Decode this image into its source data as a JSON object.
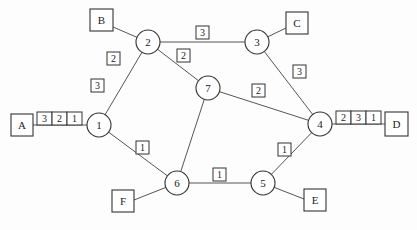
{
  "diagram": {
    "type": "network-topology",
    "routers": [
      {
        "id": "1",
        "label": "1",
        "x": 99,
        "y": 125
      },
      {
        "id": "2",
        "label": "2",
        "x": 148,
        "y": 42
      },
      {
        "id": "3",
        "label": "3",
        "x": 257,
        "y": 42
      },
      {
        "id": "4",
        "label": "4",
        "x": 320,
        "y": 124
      },
      {
        "id": "5",
        "label": "5",
        "x": 263,
        "y": 183
      },
      {
        "id": "6",
        "label": "6",
        "x": 177,
        "y": 183
      },
      {
        "id": "7",
        "label": "7",
        "x": 208,
        "y": 88
      }
    ],
    "hosts": [
      {
        "id": "A",
        "label": "A",
        "x": 11,
        "y": 114
      },
      {
        "id": "B",
        "label": "B",
        "x": 90,
        "y": 9
      },
      {
        "id": "C",
        "label": "C",
        "x": 286,
        "y": 12
      },
      {
        "id": "D",
        "label": "D",
        "x": 385,
        "y": 112
      },
      {
        "id": "E",
        "label": "E",
        "x": 304,
        "y": 189
      },
      {
        "id": "F",
        "label": "F",
        "x": 112,
        "y": 190
      }
    ],
    "links": [
      {
        "from": "1",
        "to": "2",
        "weights": [
          "2",
          "3"
        ]
      },
      {
        "from": "2",
        "to": "3",
        "weights": [
          "3"
        ]
      },
      {
        "from": "2",
        "to": "7",
        "weights": [
          "2"
        ]
      },
      {
        "from": "3",
        "to": "4",
        "weights": [
          "3"
        ]
      },
      {
        "from": "7",
        "to": "4",
        "weights": [
          "2"
        ]
      },
      {
        "from": "7",
        "to": "6",
        "weights": []
      },
      {
        "from": "1",
        "to": "6",
        "weights": [
          "1"
        ]
      },
      {
        "from": "6",
        "to": "5",
        "weights": [
          "1"
        ]
      },
      {
        "from": "5",
        "to": "4",
        "weights": [
          "1"
        ]
      },
      {
        "from": "A",
        "to": "1",
        "weights": []
      },
      {
        "from": "B",
        "to": "2",
        "weights": []
      },
      {
        "from": "C",
        "to": "3",
        "weights": []
      },
      {
        "from": "D",
        "to": "4",
        "weights": []
      },
      {
        "from": "E",
        "to": "5",
        "weights": []
      },
      {
        "from": "F",
        "to": "6",
        "weights": []
      }
    ],
    "weight_labels": [
      {
        "value": "2",
        "x": 113,
        "y": 58
      },
      {
        "value": "3",
        "x": 93,
        "y": 80
      },
      {
        "value": "3",
        "x": 195,
        "y": 25
      },
      {
        "value": "2",
        "x": 176,
        "y": 50
      },
      {
        "value": "3",
        "x": 289,
        "y": 67
      },
      {
        "value": "2",
        "x": 252,
        "y": 84
      },
      {
        "value": "1",
        "x": 136,
        "y": 140
      },
      {
        "value": "1",
        "x": 212,
        "y": 167
      },
      {
        "value": "1",
        "x": 278,
        "y": 143
      }
    ],
    "queues": [
      {
        "near": "A",
        "x": 37,
        "y": 112,
        "cells": [
          "3",
          "2",
          "1"
        ]
      },
      {
        "near": "D",
        "x": 336,
        "y": 111,
        "cells": [
          "2",
          "3",
          "1"
        ]
      }
    ]
  }
}
